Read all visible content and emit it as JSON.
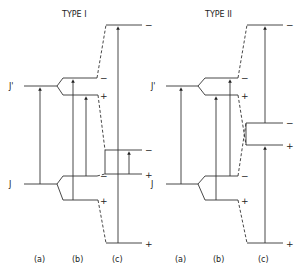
{
  "titles": {
    "type1": "TYPE I",
    "type2": "TYPE II"
  },
  "labels": {
    "upper_level": "J'",
    "upper_sub": "q'",
    "lower_level": "J",
    "lower_sub": "q"
  },
  "signs": {
    "minus": "−",
    "plus": "+"
  },
  "columns": {
    "a": "(a)",
    "b": "(b)",
    "c": "(c)"
  }
}
